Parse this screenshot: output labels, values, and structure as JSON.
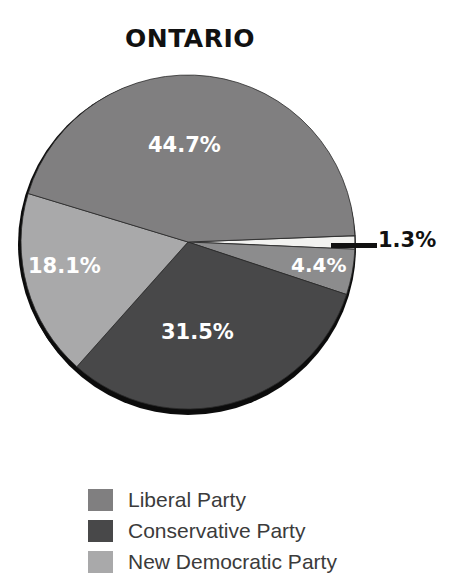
{
  "chart_data": {
    "type": "pie",
    "title": "ONTARIO",
    "categories": [
      "Liberal Party",
      "Conservative Party",
      "New Democratic Party",
      "Other",
      "Other 2"
    ],
    "values": [
      44.7,
      31.5,
      18.1,
      4.4,
      1.3
    ],
    "value_labels": [
      "44.7%",
      "31.5%",
      "18.1%",
      "4.4%",
      "1.3%"
    ],
    "unit": "%",
    "legend_position": "bottom-left",
    "grid": false,
    "xlabel": "",
    "ylabel": "",
    "colors": [
      "#807f80",
      "#484849",
      "#a9a9aa",
      "#8c8c8d",
      "#f2f2f0"
    ],
    "slices": [
      {
        "name": "Liberal Party",
        "label": "44.7%",
        "value": 44.7,
        "color": "#807f80",
        "label_placement": "inside"
      },
      {
        "name": "Conservative Party",
        "label": "31.5%",
        "value": 31.5,
        "color": "#484849",
        "label_placement": "inside"
      },
      {
        "name": "New Democratic Party",
        "label": "18.1%",
        "value": 18.1,
        "color": "#a9a9aa",
        "label_placement": "inside"
      },
      {
        "name": "Other",
        "label": "4.4%",
        "value": 4.4,
        "color": "#8c8c8d",
        "label_placement": "inside"
      },
      {
        "name": "Other 2",
        "label": "1.3%",
        "value": 1.3,
        "color": "#f2f2f0",
        "label_placement": "outside"
      }
    ]
  },
  "title": {
    "text": "ONTARIO"
  },
  "labels": {
    "liberal": "44.7%",
    "conservative": "31.5%",
    "ndp": "18.1%",
    "other": "4.4%",
    "other2": "1.3%"
  },
  "legend": {
    "items": [
      {
        "label": "Liberal Party",
        "color": "#807f80"
      },
      {
        "label": "Conservative Party",
        "color": "#484849"
      },
      {
        "label": "New Democratic Party",
        "color": "#a9a9aa"
      }
    ]
  }
}
